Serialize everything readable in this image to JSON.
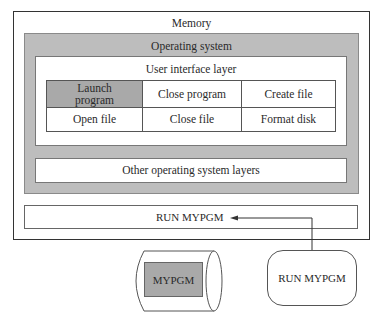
{
  "diagram": {
    "memory_label": "Memory",
    "os_label": "Operating system",
    "ui_layer_label": "User interface layer",
    "commands": [
      [
        "Launch program",
        "Close program",
        "Create file"
      ],
      [
        "Open file",
        "Close file",
        "Format disk"
      ]
    ],
    "highlighted_command": "Launch program",
    "other_layers_label": "Other operating system layers",
    "memory_command_label": "RUN MYPGM",
    "disk_program_label": "MYPGM",
    "user_command_label": "RUN MYPGM"
  },
  "colors": {
    "gray_fill": "#bdbdbd",
    "highlight_fill": "#a9a9a9",
    "line": "#333333"
  }
}
